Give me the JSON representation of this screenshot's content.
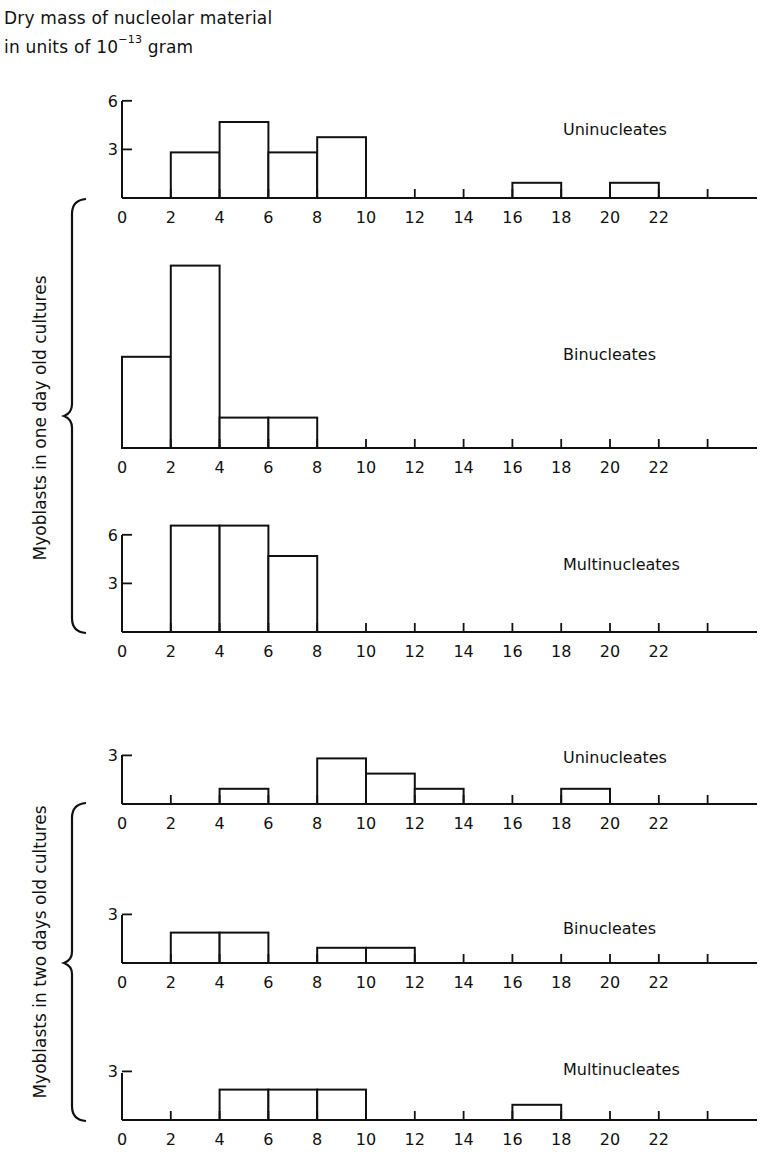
{
  "header": {
    "line1": "Dry mass of nucleolar material",
    "line2_prefix": "in units of 10",
    "line2_exponent": "−13",
    "line2_suffix": "gram"
  },
  "groups": [
    {
      "label": "Myoblasts in one day old cultures"
    },
    {
      "label": "Myoblasts in two days old cultures"
    }
  ],
  "chart_data": [
    {
      "type": "bar",
      "title": "Uninucleates",
      "group": "Myoblasts in one day old cultures",
      "xlabel": "Dry mass of nucleolar material (10^-13 g)",
      "ylabel": "Number of cells",
      "bin_edges": [
        0,
        2,
        4,
        6,
        8,
        10,
        12,
        14,
        16,
        18,
        20,
        22,
        24
      ],
      "categories": [
        "0-2",
        "2-4",
        "4-6",
        "6-8",
        "8-10",
        "10-12",
        "12-14",
        "14-16",
        "16-18",
        "18-20",
        "20-22",
        "22-24"
      ],
      "values": [
        0,
        3,
        5,
        3,
        4,
        0,
        0,
        0,
        1,
        0,
        1,
        0
      ],
      "yticks": [
        3,
        6
      ],
      "x_tick_labels": [
        "0",
        "2",
        "4",
        "6",
        "8",
        "10",
        "12",
        "14",
        "16",
        "18",
        "20",
        "22"
      ]
    },
    {
      "type": "bar",
      "title": "Binucleates",
      "group": "Myoblasts in one day old cultures",
      "xlabel": "Dry mass of nucleolar material (10^-13 g)",
      "ylabel": "Number of cells",
      "bin_edges": [
        0,
        2,
        4,
        6,
        8,
        10,
        12,
        14,
        16,
        18,
        20,
        22,
        24
      ],
      "categories": [
        "0-2",
        "2-4",
        "4-6",
        "6-8",
        "8-10",
        "10-12",
        "12-14",
        "14-16",
        "16-18",
        "18-20",
        "20-22",
        "22-24"
      ],
      "values": [
        6,
        12,
        2,
        2,
        0,
        0,
        0,
        0,
        0,
        0,
        0,
        0
      ],
      "yticks": [],
      "x_tick_labels": [
        "0",
        "2",
        "4",
        "6",
        "8",
        "10",
        "12",
        "14",
        "16",
        "18",
        "20",
        "22"
      ]
    },
    {
      "type": "bar",
      "title": "Multinucleates",
      "group": "Myoblasts in one day old cultures",
      "xlabel": "Dry mass of nucleolar material (10^-13 g)",
      "ylabel": "Number of cells",
      "bin_edges": [
        0,
        2,
        4,
        6,
        8,
        10,
        12,
        14,
        16,
        18,
        20,
        22,
        24
      ],
      "categories": [
        "0-2",
        "2-4",
        "4-6",
        "6-8",
        "8-10",
        "10-12",
        "12-14",
        "14-16",
        "16-18",
        "18-20",
        "20-22",
        "22-24"
      ],
      "values": [
        0,
        7,
        7,
        5,
        0,
        0,
        0,
        0,
        0,
        0,
        0,
        0
      ],
      "yticks": [
        3,
        6
      ],
      "x_tick_labels": [
        "0",
        "2",
        "4",
        "6",
        "8",
        "10",
        "12",
        "14",
        "16",
        "18",
        "20",
        "22"
      ]
    },
    {
      "type": "bar",
      "title": "Uninucleates",
      "group": "Myoblasts in two days old cultures",
      "xlabel": "Dry mass of nucleolar material (10^-13 g)",
      "ylabel": "Number of cells",
      "bin_edges": [
        0,
        2,
        4,
        6,
        8,
        10,
        12,
        14,
        16,
        18,
        20,
        22,
        24
      ],
      "categories": [
        "0-2",
        "2-4",
        "4-6",
        "6-8",
        "8-10",
        "10-12",
        "12-14",
        "14-16",
        "16-18",
        "18-20",
        "20-22",
        "22-24"
      ],
      "values": [
        0,
        0,
        1,
        0,
        3,
        2,
        1,
        0,
        0,
        1,
        0,
        0
      ],
      "yticks": [
        3
      ],
      "x_tick_labels": [
        "0",
        "2",
        "4",
        "6",
        "8",
        "10",
        "12",
        "14",
        "16",
        "18",
        "20",
        "22"
      ]
    },
    {
      "type": "bar",
      "title": "Binucleates",
      "group": "Myoblasts in two days old cultures",
      "xlabel": "Dry mass of nucleolar material (10^-13 g)",
      "ylabel": "Number of cells",
      "bin_edges": [
        0,
        2,
        4,
        6,
        8,
        10,
        12,
        14,
        16,
        18,
        20,
        22,
        24
      ],
      "categories": [
        "0-2",
        "2-4",
        "4-6",
        "6-8",
        "8-10",
        "10-12",
        "12-14",
        "14-16",
        "16-18",
        "18-20",
        "20-22",
        "22-24"
      ],
      "values": [
        0,
        2,
        2,
        0,
        1,
        1,
        0,
        0,
        0,
        0,
        0,
        0
      ],
      "yticks": [
        3
      ],
      "x_tick_labels": [
        "0",
        "2",
        "4",
        "6",
        "8",
        "10",
        "12",
        "14",
        "16",
        "18",
        "20",
        "22"
      ]
    },
    {
      "type": "bar",
      "title": "Multinucleates",
      "group": "Myoblasts in two days old cultures",
      "xlabel": "Dry mass of nucleolar material (10^-13 g)",
      "ylabel": "Number of cells",
      "bin_edges": [
        0,
        2,
        4,
        6,
        8,
        10,
        12,
        14,
        16,
        18,
        20,
        22,
        24
      ],
      "categories": [
        "0-2",
        "2-4",
        "4-6",
        "6-8",
        "8-10",
        "10-12",
        "12-14",
        "14-16",
        "16-18",
        "18-20",
        "20-22",
        "22-24"
      ],
      "values": [
        0,
        0,
        2,
        2,
        2,
        0,
        0,
        0,
        1,
        0,
        0,
        0
      ],
      "yticks": [
        3
      ],
      "x_tick_labels": [
        "0",
        "2",
        "4",
        "6",
        "8",
        "10",
        "12",
        "14",
        "16",
        "18",
        "20",
        "22"
      ]
    }
  ]
}
